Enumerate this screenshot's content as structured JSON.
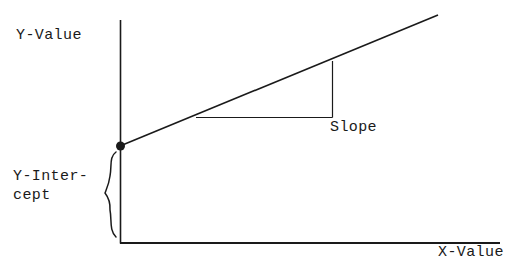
{
  "figure": {
    "background_color": "#ffffff",
    "ink_color": "#1a1a1a",
    "width": 527,
    "height": 276
  },
  "labels": {
    "y_axis": "Y-Value",
    "x_axis": "X-Value",
    "slope": "Slope",
    "y_intercept_line1": "Y-Inter-",
    "y_intercept_line2": "cept"
  },
  "chart_data": {
    "type": "line",
    "title": "",
    "xlabel": "X-Value",
    "ylabel": "Y-Value",
    "grid": false,
    "legend": null,
    "axes": {
      "x_axis": {
        "x1": 120,
        "y1": 243,
        "x2": 500,
        "y2": 243
      },
      "y_axis": {
        "x1": 120,
        "y1": 20,
        "x2": 120,
        "y2": 243
      },
      "x_ticks": [],
      "y_ticks": []
    },
    "series": [
      {
        "name": "trend-line",
        "type": "line",
        "points": [
          {
            "x": 120,
            "y": 146
          },
          {
            "x": 438,
            "y": 15
          }
        ]
      }
    ],
    "markers": [
      {
        "name": "y-intercept-point",
        "x": 120,
        "y": 146,
        "radius": 4.5,
        "filled": true
      }
    ],
    "annotations": [
      {
        "name": "slope-triangle",
        "label": "Slope",
        "run": {
          "x1": 196,
          "y1": 117,
          "x2": 332,
          "y2": 117
        },
        "rise": {
          "x1": 332,
          "y1": 117,
          "x2": 332,
          "y2": 61
        },
        "label_position": {
          "x": 330,
          "y": 118
        }
      },
      {
        "name": "y-intercept-brace",
        "label": "Y-Intercept",
        "orientation": "left-pointing",
        "span": {
          "top_y": 152,
          "bottom_y": 237,
          "x": 116,
          "tip_x": 105,
          "tip_y": 193
        }
      }
    ]
  }
}
